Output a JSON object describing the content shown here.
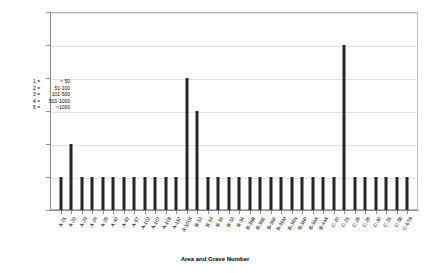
{
  "chart_data": {
    "type": "bar",
    "title": "",
    "xlabel": "Area and Grave Number",
    "ylabel": "",
    "ylim": [
      0,
      6
    ],
    "yticks": [
      0,
      1,
      2,
      3,
      4,
      5,
      6
    ],
    "grid": true,
    "legend_position": "left-inside",
    "bar_color": "#262626",
    "categories": [
      "A-21",
      "A-22",
      "A-23",
      "A-24",
      "A-25",
      "A-40",
      "A-82",
      "A-87",
      "A-102",
      "A-107",
      "A-108",
      "A-110",
      "A-1004",
      "B-12",
      "B-14",
      "B-16",
      "B-32",
      "B-34",
      "B-36B",
      "B-36E",
      "B-36F",
      "B-36M",
      "B-36N",
      "B-36P",
      "B-38A",
      "B-44A",
      "C-20",
      "C-21",
      "C-25",
      "C-26",
      "C-30",
      "C-31",
      "C-38",
      "C-67A"
    ],
    "values": [
      1,
      2,
      1,
      1,
      1,
      1,
      1,
      1,
      1,
      1,
      1,
      1,
      4,
      3,
      1,
      1,
      1,
      1,
      1,
      1,
      1,
      1,
      1,
      1,
      1,
      1,
      1,
      5,
      1,
      1,
      1,
      1,
      1,
      1
    ],
    "legend_title": "",
    "legend_entries": [
      {
        "code": "1 =",
        "range": "< 50"
      },
      {
        "code": "2 =",
        "range": "51-100"
      },
      {
        "code": "3 =",
        "range": "101-500"
      },
      {
        "code": "4 =",
        "range": "501-1000"
      },
      {
        "code": "5 =",
        "range": ">1000"
      }
    ]
  }
}
